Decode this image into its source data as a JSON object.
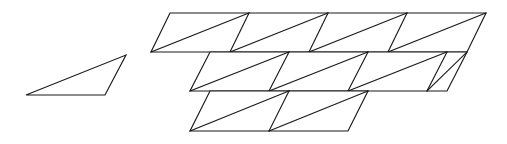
{
  "figure": {
    "background_color": "#ffffff",
    "stroke_color": "#1a1a1a",
    "stroke_width": 1.15,
    "canvas": {
      "width": 507,
      "height": 144
    }
  },
  "unit_triangle": {
    "name": "unit-triangle",
    "vertices": [
      {
        "x": 26,
        "y": 95
      },
      {
        "x": 105,
        "y": 95
      },
      {
        "x": 126,
        "y": 55
      }
    ],
    "edge_count": 3
  },
  "tessellation": {
    "name": "triangle-tessellation",
    "cell_dx": 79,
    "cell_dy": 39.5,
    "row_shear": -20,
    "rows": [
      {
        "name": "row-top",
        "index": 0,
        "cell_count": 4,
        "y_top": 13,
        "y_bottom": 52,
        "x_top_start": 170,
        "x_bottom_start": 151
      },
      {
        "name": "row-middle",
        "index": 1,
        "cell_count": 4,
        "y_top": 52,
        "y_bottom": 91,
        "x_top_start": 210,
        "x_bottom_start": 190
      },
      {
        "name": "row-bottom",
        "index": 2,
        "cell_count": 2,
        "y_top": 91,
        "y_bottom": 131,
        "x_top_start": 210,
        "x_bottom_start": 190
      }
    ],
    "total_parallelograms": 10,
    "total_triangles": 20
  },
  "geometry": {
    "unit_triangle_path": "M 26 95 L 105 95 L 126 55 Z",
    "row0_outline": "M 170 13 L 486 13 L 467 52 L 151 52 Z",
    "row1_outline": "M 210 52 L 467 52 L 447 91 L 190 91 Z",
    "row2_outline": "M 210 91 L 368 91 L 348 131 L 190 131 Z",
    "row0_verticals": [
      "M 249 13 L 230 52",
      "M 328 13 L 309 52",
      "M 407 13 L 388 52"
    ],
    "row0_diagonals": [
      "M 151 52 L 249 13",
      "M 230 52 L 328 13",
      "M 309 52 L 407 13",
      "M 388 52 L 486 13"
    ],
    "row1_verticals": [
      "M 289 52 L 269 91",
      "M 368 52 L 348 91",
      "M 447 52 L 427 91"
    ],
    "row1_diagonals": [
      "M 190 91 L 289 52",
      "M 269 91 L 368 52",
      "M 348 91 L 447 52",
      "M 427 91 L 467 52"
    ],
    "row2_verticals": [
      "M 289 91 L 269 131"
    ],
    "row2_diagonals": [
      "M 190 131 L 289 91",
      "M 269 131 L 368 91"
    ]
  }
}
